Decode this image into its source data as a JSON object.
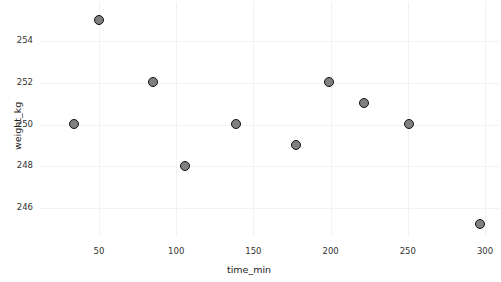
{
  "chart_data": {
    "type": "scatter",
    "title": "",
    "xlabel": "time_min",
    "ylabel": "weight_kg",
    "xlim": [
      20,
      310
    ],
    "ylim": [
      244.4,
      255.9
    ],
    "xticks": [
      50,
      100,
      150,
      200,
      250,
      300
    ],
    "xtick_labels": [
      "50",
      "100",
      "150",
      "200",
      "250",
      "300"
    ],
    "yticks": [
      246,
      248,
      250,
      252,
      254
    ],
    "ytick_labels": [
      "246",
      "248",
      "250",
      "252",
      "254"
    ],
    "grid": true,
    "grid_color": "#f2f2f2",
    "legend": null,
    "marker": {
      "shape": "circle",
      "face_color": "#808080",
      "edge_color": "#111111",
      "size_px": 11
    },
    "x": [
      34,
      50,
      85,
      106,
      139,
      178,
      199,
      222,
      251,
      297
    ],
    "y": [
      250.0,
      255.0,
      252.0,
      248.0,
      250.0,
      249.0,
      252.0,
      251.0,
      250.0,
      245.2
    ],
    "points": [
      {
        "x": 34,
        "y": 250.0
      },
      {
        "x": 50,
        "y": 255.0
      },
      {
        "x": 85,
        "y": 252.0
      },
      {
        "x": 106,
        "y": 248.0
      },
      {
        "x": 139,
        "y": 250.0
      },
      {
        "x": 178,
        "y": 249.0
      },
      {
        "x": 199,
        "y": 252.0
      },
      {
        "x": 222,
        "y": 251.0
      },
      {
        "x": 251,
        "y": 250.0
      },
      {
        "x": 297,
        "y": 245.2
      }
    ]
  },
  "axes": {
    "x_title": "time_min",
    "y_title": "weight_kg"
  }
}
